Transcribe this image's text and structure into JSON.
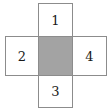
{
  "figure": {
    "name": "cross-shaped-grid-diagram",
    "colors": {
      "background": "#ffffff",
      "border": "#8c8c8c",
      "shaded_fill": "#a3a3a3",
      "text": "#1a1a1a"
    },
    "cells": [
      {
        "id": "top",
        "label": "1",
        "shaded": false,
        "position": "top"
      },
      {
        "id": "left",
        "label": "2",
        "shaded": false,
        "position": "left"
      },
      {
        "id": "center",
        "label": "",
        "shaded": true,
        "position": "center"
      },
      {
        "id": "right",
        "label": "4",
        "shaded": false,
        "position": "right"
      },
      {
        "id": "bottom",
        "label": "3",
        "shaded": false,
        "position": "bottom"
      }
    ]
  }
}
